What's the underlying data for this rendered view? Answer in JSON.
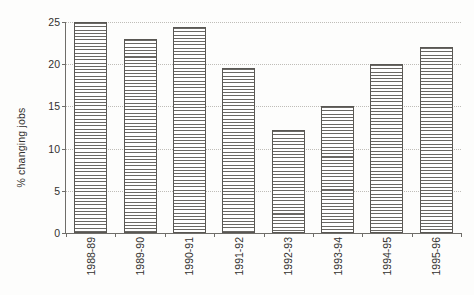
{
  "chart_data": {
    "type": "bar",
    "title": "",
    "subtitle": "",
    "xlabel": "",
    "ylabel": "% changing jobs",
    "categories": [
      "1988-89",
      "1989-90",
      "1990-91",
      "1991-92",
      "1992-93",
      "1993-94",
      "1994-95",
      "1995-96"
    ],
    "values": [
      25,
      23,
      24.4,
      19.6,
      12.2,
      15,
      20,
      22
    ],
    "ylim": [
      0,
      25
    ],
    "ytick_labels": [
      "0",
      "5",
      "10",
      "15",
      "20",
      "25"
    ],
    "ytick_values": [
      0,
      5,
      10,
      15,
      20,
      25
    ],
    "grid": "horizontal-dotted",
    "legend": "none",
    "series": [
      {
        "name": "% changing jobs",
        "values": [
          25,
          23,
          24.4,
          19.6,
          12.2,
          15,
          20,
          22
        ]
      }
    ],
    "bar_fill": "horizontal-hatch",
    "colors": {
      "bar_line": "#6a6864",
      "bar_border": "#595753",
      "bar_background": "#ffffff",
      "gridline": "#bfbdb8",
      "axis": "#6f6d69",
      "text": "#33312f",
      "page_background": "#fdfdfc"
    }
  }
}
